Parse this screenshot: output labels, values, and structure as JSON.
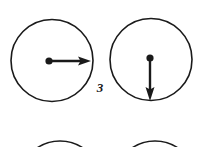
{
  "figure": {
    "label": "3",
    "width": 205,
    "height": 147,
    "background_color": "#ffffff",
    "stroke_color": "#1a1a1a",
    "shapes": {
      "circle_top_left": {
        "name": "circle-top-left",
        "cx": 52,
        "cy": 60.5,
        "r": 41,
        "stroke_width": 1.6,
        "fill": "none"
      },
      "circle_top_right": {
        "name": "circle-top-right",
        "cx": 151,
        "cy": 59.5,
        "r": 41,
        "stroke_width": 1.6,
        "fill": "none"
      },
      "circle_bottom_left": {
        "name": "circle-bottom-left-clipped",
        "cx": 60,
        "cy": 182,
        "r": 41,
        "stroke_width": 1.6,
        "fill": "none"
      },
      "circle_bottom_right": {
        "name": "circle-bottom-right-clipped",
        "cx": 155,
        "cy": 182,
        "r": 41,
        "stroke_width": 1.6,
        "fill": "none"
      },
      "dot_left": {
        "name": "center-dot-left",
        "cx": 49,
        "cy": 61,
        "r": 3.6,
        "fill": "#1a1a1a"
      },
      "dot_right": {
        "name": "center-dot-right",
        "cx": 150,
        "cy": 58,
        "r": 3.6,
        "fill": "#1a1a1a"
      },
      "arrow_right": {
        "name": "vector-arrow-right",
        "direction": "right",
        "x1": 49,
        "y1": 61,
        "x2": 91,
        "y2": 61,
        "shaft_width": 2.4,
        "head_length": 12,
        "head_half_width": 4.5
      },
      "arrow_down": {
        "name": "vector-arrow-down",
        "direction": "down",
        "x1": 150,
        "y1": 58,
        "x2": 150,
        "y2": 101,
        "shaft_width": 2.4,
        "head_length": 13,
        "head_half_width": 4.5
      }
    }
  }
}
